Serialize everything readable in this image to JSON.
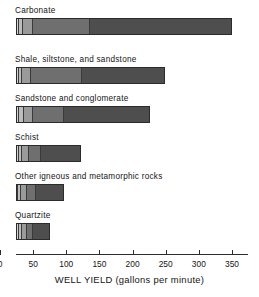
{
  "chart_data": {
    "type": "bar",
    "orientation": "horizontal",
    "subtype": "stacked-percentile",
    "title": "",
    "xlabel": "WELL YIELD (gallons per minute)",
    "ylabel": "",
    "xlim": [
      0,
      350
    ],
    "xticks": [
      0,
      50,
      100,
      150,
      200,
      250,
      300,
      350
    ],
    "xticklabels": [
      "0",
      "50",
      "100",
      "150",
      "200",
      "250",
      "300",
      "350"
    ],
    "grid": false,
    "legend": "none",
    "categories": [
      "Carbonate",
      "Shale, siltstone, and sandstone",
      "Sandstone and conglomerate",
      "Schist",
      "Other igneous and metamorphic rocks",
      "Quartzite"
    ],
    "segment_colors": [
      "#d4d4d4",
      "#bdbdbd",
      "#9a9a9a",
      "#6f6f6f",
      "#4e4e4e"
    ],
    "series": [
      {
        "name": "Carbonate",
        "boundaries": [
          0,
          4,
          10,
          25,
          112,
          326
        ],
        "total": 326
      },
      {
        "name": "Shale, siltstone, and sandstone",
        "boundaries": [
          0,
          4,
          9,
          22,
          100,
          225
        ],
        "total": 225
      },
      {
        "name": "Sandstone and conglomerate",
        "boundaries": [
          0,
          5,
          12,
          25,
          72,
          202
        ],
        "total": 202
      },
      {
        "name": "Schist",
        "boundaries": [
          0,
          4,
          9,
          20,
          38,
          98
        ],
        "total": 98
      },
      {
        "name": "Other igneous and metamorphic rocks",
        "boundaries": [
          0,
          3,
          8,
          16,
          30,
          72
        ],
        "total": 72
      },
      {
        "name": "Quartzite",
        "boundaries": [
          0,
          4,
          9,
          17,
          26,
          52
        ],
        "total": 52
      }
    ]
  },
  "axis": {
    "title": "WELL YIELD (gallons per minute)",
    "ticks": [
      {
        "value": 0,
        "label": "0"
      },
      {
        "value": 50,
        "label": "50"
      },
      {
        "value": 100,
        "label": "100"
      },
      {
        "value": 150,
        "label": "150"
      },
      {
        "value": 200,
        "label": "200"
      },
      {
        "value": 250,
        "label": "250"
      },
      {
        "value": 300,
        "label": "300"
      },
      {
        "value": 350,
        "label": "350"
      }
    ]
  },
  "labels": {
    "carbonate": "Carbonate",
    "shale": "Shale, siltstone, and sandstone",
    "sandstone": "Sandstone and conglomerate",
    "schist": "Schist",
    "other_igneous": "Other igneous and metamorphic rocks",
    "quartzite": "Quartzite"
  }
}
